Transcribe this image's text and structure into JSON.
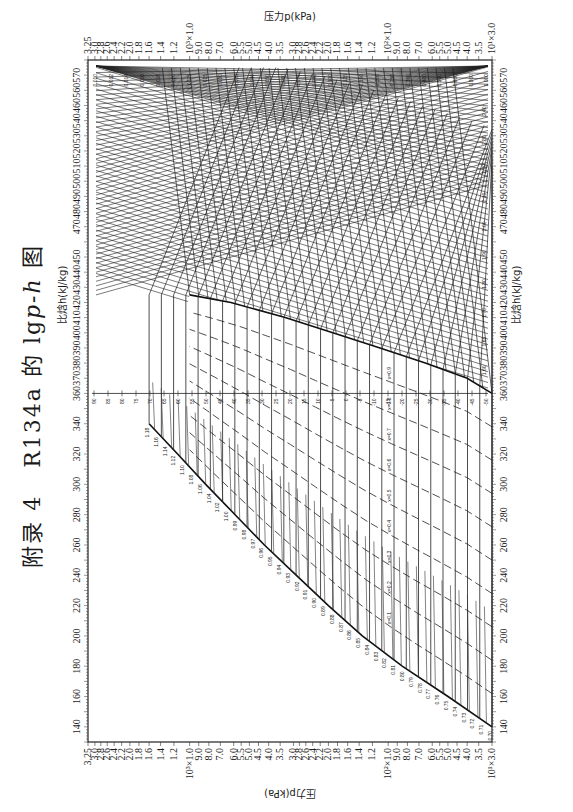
{
  "page": {
    "title_prefix": "附录 4",
    "title_main": "R134a 的 lg",
    "title_italic": "p-h",
    "title_suffix": "图"
  },
  "chart_data": {
    "type": "line",
    "refrigerant": "R134a",
    "xlabel": "比焓h(kJ/kg)",
    "ylabel": "压力p(kPa)",
    "x_ticks": [
      140,
      160,
      180,
      200,
      220,
      240,
      260,
      280,
      300,
      320,
      340,
      360,
      370,
      380,
      390,
      400,
      410,
      420,
      430,
      440,
      450,
      470,
      480,
      490,
      500,
      510,
      520,
      530,
      540,
      460,
      550,
      560,
      570
    ],
    "xlim": [
      130,
      580
    ],
    "y_scale": "log",
    "ylim": [
      30,
      3250
    ],
    "y_ticks_left": [
      "3.25",
      "3.0",
      "2.8",
      "2.6",
      "2.4",
      "2.2",
      "2.0",
      "1.8",
      "1.6",
      "1.4",
      "1.2",
      "10³×1.0",
      "9.0",
      "8.0",
      "7.0",
      "6.0",
      "5.5",
      "5.0",
      "4.5",
      "4.0",
      "3.5",
      "3.0",
      "2.8",
      "2.6",
      "2.4",
      "2.2",
      "2.0",
      "1.8",
      "1.6",
      "1.4",
      "1.2",
      "10²×1.0",
      "9.0",
      "8.0",
      "7.0",
      "6.0",
      "5.5",
      "5.0",
      "4.5",
      "4.0",
      "3.5",
      "10¹×3.0"
    ],
    "y_ticks_kpa": [
      3250,
      3000,
      2800,
      2600,
      2400,
      2200,
      2000,
      1800,
      1600,
      1400,
      1200,
      1000,
      900,
      800,
      700,
      600,
      550,
      500,
      450,
      400,
      350,
      300,
      280,
      260,
      240,
      220,
      200,
      180,
      160,
      140,
      120,
      100,
      90,
      80,
      70,
      60,
      55,
      50,
      45,
      40,
      35,
      30
    ],
    "temperature_scale_C": [
      90,
      85,
      80,
      75,
      70,
      65,
      60,
      55,
      50,
      45,
      40,
      35,
      30,
      25,
      20,
      15,
      10,
      5,
      0,
      -5,
      -10,
      -15,
      -20,
      -25,
      -30,
      -35,
      -40,
      -45,
      -50
    ],
    "specific_volume_labels_m3kg": [
      "0.010",
      "0.012",
      "0.014",
      "0.016",
      "0.018",
      "0.020",
      "0.0225",
      "0.025",
      "0.030",
      "0.035",
      "0.040",
      "0.050",
      "0.060",
      "0.070",
      "0.080",
      "0.100",
      "0.125",
      "0.150",
      "0.200",
      "0.250",
      "0.300",
      "0.400",
      "0.500",
      "0.600",
      "0.800",
      "1.000"
    ],
    "liquid_entropy_labels": [
      "0.70",
      "0.71",
      "0.72",
      "0.73",
      "0.74",
      "0.75",
      "0.76",
      "0.77",
      "0.78",
      "0.79",
      "0.80",
      "0.81",
      "0.82",
      "0.83",
      "0.84",
      "0.85",
      "0.86",
      "0.87",
      "0.88",
      "0.89",
      "0.90",
      "0.91",
      "0.92",
      "0.93",
      "0.94",
      "0.95",
      "0.96",
      "0.97",
      "0.98",
      "0.99",
      "1.00",
      "1.02",
      "1.04",
      "1.06",
      "1.08",
      "1.10",
      "1.12",
      "1.14",
      "1.16",
      "1.18"
    ],
    "vapor_entropy_labels": [
      "1.60",
      "1.65",
      "1.70",
      "1.80",
      "1.90",
      "2.00",
      "2.10",
      "2.20",
      "2.30",
      "2.40"
    ],
    "quality_labels": [
      "x=0.1",
      "x=0.2",
      "x=0.3",
      "x=0.4",
      "x=0.5",
      "x=0.6",
      "x=0.7",
      "x=0.8",
      "x=0.9"
    ],
    "saturation_liquid": {
      "h": [
        140,
        160,
        180,
        200,
        220,
        240,
        260,
        280,
        300,
        320,
        340
      ],
      "p": [
        30,
        50,
        85,
        135,
        200,
        290,
        420,
        590,
        830,
        1150,
        1600
      ]
    },
    "saturation_vapor": {
      "h": [
        360,
        370,
        380,
        390,
        400,
        410,
        420,
        425
      ],
      "p": [
        30,
        40,
        65,
        110,
        190,
        330,
        620,
        1000
      ]
    },
    "grid": false,
    "legend": null
  },
  "axes": {
    "x_title_top": "比焓h(kJ/kg)",
    "x_title_bottom": "比焓h(kJ/kg)",
    "y_title_left": "压力p(kPa)",
    "y_title_right": "压力p(kPa)",
    "refrigerant_label": "R134a"
  }
}
